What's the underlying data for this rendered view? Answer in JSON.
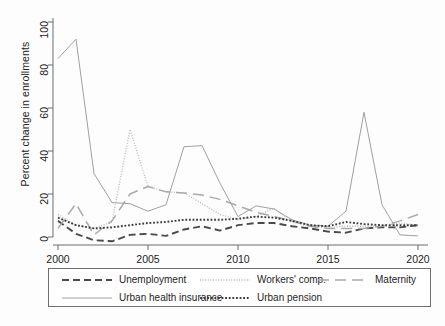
{
  "chart_data": {
    "type": "line",
    "title": "",
    "subtitle": "",
    "xlabel": "",
    "ylabel": "Percent change in enrollments",
    "xlim": [
      2000,
      2020
    ],
    "ylim": [
      0,
      100
    ],
    "ytick_labels": [
      "0",
      "20",
      "40",
      "60",
      "80",
      "100"
    ],
    "ytick_values": [
      0,
      20,
      40,
      60,
      80,
      100
    ],
    "xtick_labels": [
      "2000",
      "2005",
      "2010",
      "2015",
      "2020"
    ],
    "xtick_values": [
      2000,
      2005,
      2010,
      2015,
      2020
    ],
    "x": [
      2000,
      2001,
      2002,
      2003,
      2004,
      2005,
      2006,
      2007,
      2008,
      2009,
      2010,
      2011,
      2012,
      2013,
      2014,
      2015,
      2016,
      2017,
      2018,
      2019,
      2020
    ],
    "grid": false,
    "legend_position": "bottom",
    "series": [
      {
        "name": "Unemployment",
        "style": "dashed",
        "color": "#4a4a4a",
        "values": [
          7.5,
          1.5,
          -1.5,
          -2.0,
          1.0,
          1.5,
          0.5,
          3.5,
          5.0,
          3.0,
          5.5,
          6.5,
          6.5,
          5.0,
          4.0,
          2.5,
          2.0,
          4.0,
          4.5,
          4.5,
          5.5
        ]
      },
      {
        "name": "Workers' comp.",
        "style": "dotted-fine",
        "color": "#b8b8b8",
        "values": [
          10.5,
          5.5,
          4.0,
          7.0,
          50.0,
          23.5,
          21.0,
          20.5,
          15.5,
          10.5,
          8.0,
          9.5,
          13.5,
          7.0,
          5.0,
          4.5,
          5.0,
          5.0,
          5.0,
          6.5,
          5.5
        ]
      },
      {
        "name": "Maternity",
        "style": "dashed-long",
        "color": "#a9a9a9",
        "values": [
          4.0,
          15.5,
          1.0,
          7.5,
          20.0,
          23.5,
          21.0,
          20.5,
          19.5,
          17.5,
          14.5,
          11.5,
          9.5,
          7.5,
          5.0,
          4.0,
          4.0,
          4.0,
          5.0,
          7.5,
          10.5
        ]
      },
      {
        "name": "Urban health insurance",
        "style": "solid",
        "color": "#a0a0a0",
        "values": [
          83.0,
          92.0,
          29.5,
          16.0,
          15.5,
          12.0,
          15.0,
          42.0,
          42.5,
          25.0,
          9.5,
          14.5,
          13.0,
          8.0,
          5.5,
          5.0,
          12.0,
          58.0,
          15.0,
          1.0,
          0.5
        ]
      },
      {
        "name": "Urban pension",
        "style": "dotted-coarse",
        "color": "#3a3a3a",
        "values": [
          9.0,
          5.5,
          4.0,
          4.5,
          5.5,
          6.5,
          7.0,
          8.0,
          8.0,
          8.0,
          8.5,
          9.5,
          9.0,
          7.5,
          5.5,
          5.0,
          7.0,
          6.0,
          5.5,
          5.5,
          5.5
        ]
      }
    ]
  },
  "axes": {
    "y_title": "Percent change in enrollments"
  },
  "legend": {
    "entries": [
      {
        "label": "Unemployment",
        "series": "Unemployment"
      },
      {
        "label": "Workers' comp.",
        "series": "Workers' comp."
      },
      {
        "label": "Maternity",
        "series": "Maternity"
      },
      {
        "label": "Urban health insurance",
        "series": "Urban health insurance"
      },
      {
        "label": "Urban pension",
        "series": "Urban pension"
      }
    ]
  }
}
